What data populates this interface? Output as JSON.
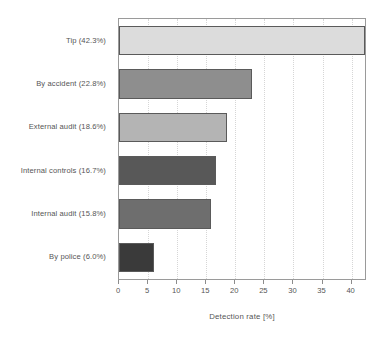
{
  "chart_data": {
    "type": "bar",
    "orientation": "horizontal",
    "title": "",
    "subtitle": "",
    "xlabel": "Detection rate [%]",
    "ylabel": "",
    "xlim": [
      0,
      42.3
    ],
    "ylim": [
      0,
      6
    ],
    "grid": true,
    "grid_axis": "x",
    "legend": false,
    "legend_position": "none",
    "xticks": [
      0,
      5,
      10,
      15,
      20,
      25,
      30,
      35,
      40
    ],
    "xticklabels": [
      "0",
      "5",
      "10",
      "15",
      "20",
      "25",
      "30",
      "35",
      "40"
    ],
    "categories": [
      "Tip (42.3%)",
      "By accident (22.8%)",
      "External audit (18.6%)",
      "Internal controls (16.7%)",
      "Internal audit (15.8%)",
      "By police (6.0%)"
    ],
    "values": [
      42.3,
      22.8,
      18.6,
      16.7,
      15.8,
      6.0
    ],
    "bar_colors": [
      "#dcdcdc",
      "#8e8e8e",
      "#b4b4b4",
      "#585858",
      "#6e6e6e",
      "#3a3a3a"
    ],
    "bar_edge_color": "#5a5a5a",
    "plot_border_color": "#9a9a9a",
    "gridline_color": "#d6d6d6",
    "text_color": "#555555",
    "background": "#ffffff"
  }
}
